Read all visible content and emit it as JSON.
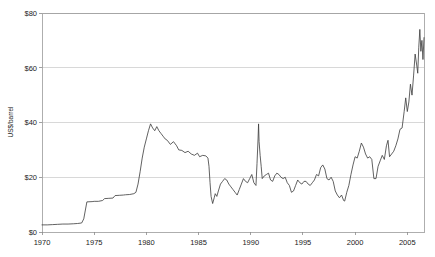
{
  "chart_data": {
    "type": "line",
    "title": "",
    "subtitle": "",
    "xlabel": "",
    "ylabel": "US$/barrel",
    "xlim": [
      1970,
      2006.6
    ],
    "ylim": [
      0,
      80
    ],
    "grid": true,
    "legend": null,
    "y_ticks": [
      0,
      20,
      40,
      60,
      80
    ],
    "y_tick_labels": [
      "$0",
      "$20",
      "$40",
      "$60",
      "$80"
    ],
    "x_ticks": [
      1970,
      1975,
      1980,
      1985,
      1990,
      1995,
      2000,
      2005
    ],
    "x_tick_labels": [
      "1970",
      "1975",
      "1980",
      "1985",
      "1990",
      "1995",
      "2000",
      "2005"
    ],
    "series": [
      {
        "name": "Crude oil price",
        "color": "#3a3a3a",
        "x": [
          1970.0,
          1970.5,
          1971.0,
          1971.5,
          1972.0,
          1972.5,
          1973.0,
          1973.4,
          1973.8,
          1974.0,
          1974.3,
          1974.8,
          1975.0,
          1975.4,
          1975.8,
          1976.0,
          1976.4,
          1976.8,
          1977.0,
          1977.4,
          1977.8,
          1978.0,
          1978.4,
          1978.8,
          1979.0,
          1979.2,
          1979.4,
          1979.6,
          1979.8,
          1980.0,
          1980.2,
          1980.4,
          1980.6,
          1980.8,
          1981.0,
          1981.2,
          1981.4,
          1981.6,
          1981.8,
          1982.0,
          1982.3,
          1982.6,
          1982.9,
          1983.1,
          1983.4,
          1983.7,
          1984.0,
          1984.3,
          1984.6,
          1984.9,
          1985.1,
          1985.4,
          1985.7,
          1985.9,
          1986.0,
          1986.1,
          1986.2,
          1986.35,
          1986.5,
          1986.6,
          1986.75,
          1986.9,
          1987.1,
          1987.3,
          1987.5,
          1987.7,
          1987.9,
          1988.1,
          1988.3,
          1988.5,
          1988.7,
          1988.9,
          1989.1,
          1989.3,
          1989.5,
          1989.7,
          1989.9,
          1990.1,
          1990.3,
          1990.5,
          1990.6,
          1990.7,
          1990.75,
          1990.8,
          1990.9,
          1991.0,
          1991.1,
          1991.3,
          1991.5,
          1991.7,
          1991.9,
          1992.1,
          1992.3,
          1992.5,
          1992.7,
          1992.9,
          1993.1,
          1993.3,
          1993.5,
          1993.7,
          1993.9,
          1994.1,
          1994.3,
          1994.5,
          1994.7,
          1994.9,
          1995.1,
          1995.3,
          1995.5,
          1995.7,
          1995.9,
          1996.1,
          1996.3,
          1996.5,
          1996.7,
          1996.9,
          1997.1,
          1997.3,
          1997.5,
          1997.7,
          1997.9,
          1998.1,
          1998.3,
          1998.5,
          1998.7,
          1998.9,
          1999.0,
          1999.2,
          1999.4,
          1999.6,
          1999.8,
          2000.0,
          2000.2,
          2000.4,
          2000.6,
          2000.8,
          2001.0,
          2001.2,
          2001.4,
          2001.6,
          2001.8,
          2002.0,
          2002.2,
          2002.4,
          2002.6,
          2002.8,
          2003.0,
          2003.15,
          2003.3,
          2003.5,
          2003.7,
          2003.9,
          2004.1,
          2004.3,
          2004.5,
          2004.7,
          2004.85,
          2005.0,
          2005.15,
          2005.3,
          2005.45,
          2005.6,
          2005.75,
          2005.9,
          2006.0,
          2006.1,
          2006.2,
          2006.3,
          2006.4,
          2006.5,
          2006.6
        ],
        "y": [
          2.6,
          2.6,
          2.7,
          2.8,
          2.9,
          2.9,
          3.0,
          3.1,
          3.3,
          4.8,
          11.0,
          11.1,
          11.2,
          11.2,
          11.5,
          12.2,
          12.3,
          12.4,
          13.3,
          13.4,
          13.5,
          13.6,
          13.7,
          14.0,
          14.5,
          17.5,
          22.0,
          27.0,
          31.0,
          34.0,
          37.0,
          39.5,
          38.0,
          37.0,
          38.5,
          37.0,
          36.0,
          35.0,
          34.0,
          33.5,
          32.0,
          33.0,
          31.5,
          30.0,
          29.8,
          29.0,
          29.5,
          28.5,
          28.0,
          28.8,
          27.5,
          28.0,
          27.8,
          27.0,
          24.0,
          18.0,
          13.0,
          10.4,
          12.5,
          14.0,
          13.0,
          15.0,
          17.5,
          18.5,
          19.5,
          19.0,
          17.5,
          16.5,
          15.5,
          14.5,
          13.5,
          15.5,
          17.5,
          19.5,
          18.5,
          18.0,
          19.5,
          21.0,
          18.0,
          17.0,
          25.0,
          34.0,
          39.5,
          33.0,
          28.0,
          24.0,
          19.5,
          20.5,
          21.0,
          21.5,
          19.0,
          18.5,
          20.5,
          21.5,
          21.0,
          20.0,
          19.5,
          20.0,
          18.0,
          17.0,
          14.5,
          15.0,
          17.0,
          19.0,
          18.0,
          17.5,
          18.5,
          18.5,
          17.5,
          17.0,
          18.0,
          19.0,
          21.0,
          20.5,
          23.5,
          24.5,
          23.0,
          19.5,
          19.0,
          20.0,
          18.5,
          15.0,
          13.5,
          12.5,
          13.5,
          11.5,
          11.3,
          14.5,
          17.0,
          21.0,
          24.5,
          27.5,
          27.0,
          29.5,
          32.5,
          31.0,
          28.5,
          27.0,
          27.5,
          26.5,
          19.5,
          19.5,
          24.0,
          26.0,
          28.0,
          26.5,
          31.5,
          33.5,
          27.5,
          28.5,
          29.5,
          31.5,
          34.0,
          37.5,
          38.0,
          44.0,
          49.0,
          44.0,
          47.5,
          54.0,
          50.0,
          57.0,
          65.0,
          61.0,
          58.0,
          67.5,
          74.0,
          66.0,
          70.0,
          63.0,
          71.0
        ]
      }
    ]
  },
  "axes": {
    "y_axis_title": "US$/barrel"
  }
}
